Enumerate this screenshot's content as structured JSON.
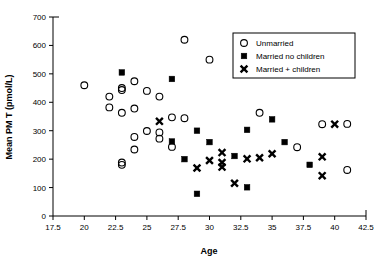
{
  "chart_data": {
    "type": "scatter",
    "title": "",
    "xlabel": "Age",
    "ylabel": "Mean PM T (pmol/L)",
    "xlim": [
      17.5,
      42.5
    ],
    "ylim": [
      0,
      700
    ],
    "xticks": [
      17.5,
      20,
      22.5,
      25,
      27.5,
      30,
      32.5,
      35,
      37.5,
      40,
      42.5
    ],
    "xtick_labels": [
      "17.5",
      "20",
      "22.5",
      "25",
      "27.5",
      "30",
      "32.5",
      "35",
      "37.5",
      "40",
      "42.5"
    ],
    "yticks": [
      0,
      100,
      200,
      300,
      400,
      500,
      600,
      700
    ],
    "ytick_labels": [
      "0",
      "100",
      "200",
      "300",
      "400",
      "500",
      "600",
      "700"
    ],
    "grid": false,
    "legend_position": "top-right",
    "series": [
      {
        "name": "Unmarried",
        "marker": "open-circle",
        "color": "#000000",
        "points": [
          [
            20.0,
            460
          ],
          [
            22.0,
            420
          ],
          [
            22.0,
            382
          ],
          [
            23.0,
            450
          ],
          [
            23.0,
            443
          ],
          [
            23.0,
            363
          ],
          [
            23.0,
            188
          ],
          [
            23.0,
            180
          ],
          [
            24.0,
            474
          ],
          [
            24.0,
            378
          ],
          [
            24.0,
            278
          ],
          [
            24.0,
            234
          ],
          [
            25.0,
            440
          ],
          [
            25.0,
            299
          ],
          [
            26.0,
            420
          ],
          [
            26.0,
            294
          ],
          [
            26.0,
            272
          ],
          [
            27.0,
            347
          ],
          [
            27.0,
            243
          ],
          [
            28.0,
            620
          ],
          [
            28.0,
            344
          ],
          [
            30.0,
            550
          ],
          [
            34.0,
            363
          ],
          [
            37.0,
            242
          ],
          [
            39.0,
            323
          ],
          [
            41.0,
            324
          ],
          [
            41.0,
            162
          ]
        ]
      },
      {
        "name": "Married no children",
        "marker": "filled-square",
        "color": "#000000",
        "points": [
          [
            23.0,
            505
          ],
          [
            27.0,
            482
          ],
          [
            27.0,
            262
          ],
          [
            28.0,
            200
          ],
          [
            29.0,
            300
          ],
          [
            29.0,
            78
          ],
          [
            30.0,
            260
          ],
          [
            32.0,
            211
          ],
          [
            33.0,
            303
          ],
          [
            33.0,
            101
          ],
          [
            35.0,
            340
          ],
          [
            36.0,
            260
          ],
          [
            38.0,
            180
          ]
        ]
      },
      {
        "name": "Married + children",
        "marker": "cross",
        "color": "#000000",
        "points": [
          [
            26.0,
            333
          ],
          [
            29.0,
            169
          ],
          [
            30.0,
            195
          ],
          [
            31.0,
            223
          ],
          [
            31.0,
            188
          ],
          [
            31.0,
            172
          ],
          [
            32.0,
            115
          ],
          [
            33.0,
            201
          ],
          [
            34.0,
            205
          ],
          [
            35.0,
            219
          ],
          [
            39.0,
            208
          ],
          [
            39.0,
            142
          ],
          [
            40.0,
            323
          ]
        ]
      }
    ]
  },
  "legend": {
    "items": [
      {
        "label": "Unmarried",
        "marker": "open-circle"
      },
      {
        "label": "Married no children",
        "marker": "filled-square"
      },
      {
        "label": "Married + children",
        "marker": "cross"
      }
    ]
  }
}
